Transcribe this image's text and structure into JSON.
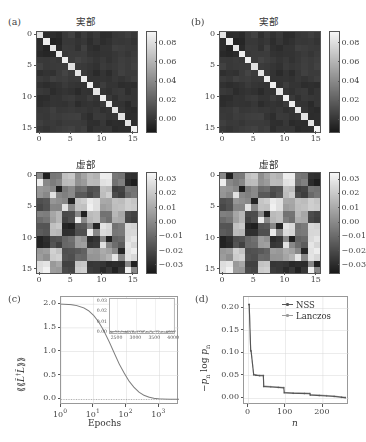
{
  "figure": {
    "panels": [
      {
        "label": "(a)",
        "title": "実部"
      },
      {
        "label": "(b)",
        "title": "実部"
      },
      {
        "label": "(a2)",
        "title": "虚部"
      },
      {
        "label": "(b2)",
        "title": "虚部"
      },
      {
        "label": "(c)",
        "title": ""
      },
      {
        "label": "(d)",
        "title": ""
      }
    ],
    "panel_a_label": "(a)",
    "panel_b_label": "(b)",
    "panel_c_label": "(c)",
    "panel_d_label": "(d)",
    "title_real": "実部",
    "title_imag": "虚部"
  },
  "heatmaps": {
    "axis_ticks": [
      "0",
      "5",
      "10",
      "15"
    ],
    "axis_tick_values": [
      0,
      5,
      10,
      15
    ],
    "size": 16,
    "real": {
      "cbar_ticks": [
        "0.08",
        "0.06",
        "0.04",
        "0.02",
        "0.00"
      ],
      "cbar_tick_values": [
        0.08,
        0.06,
        0.04,
        0.02,
        0.0
      ],
      "vmin": -0.012,
      "vmax": 0.092
    },
    "imag": {
      "cbar_ticks": [
        "0.03",
        "0.02",
        "0.01",
        "0.00",
        "−0.01",
        "−0.02",
        "−0.03"
      ],
      "cbar_tick_values": [
        0.03,
        0.02,
        0.01,
        0.0,
        -0.01,
        -0.02,
        -0.03
      ],
      "vmin": -0.035,
      "vmax": 0.035
    }
  },
  "chart_data": [
    {
      "type": "heatmap",
      "panel": "(a)",
      "title": "実部",
      "xlabel": "",
      "ylabel": "",
      "xticks": [
        0,
        5,
        10,
        15
      ],
      "yticks": [
        0,
        5,
        10,
        15
      ],
      "colorbar_ticks": [
        0.0,
        0.02,
        0.04,
        0.06,
        0.08
      ],
      "zlim": [
        -0.012,
        0.092
      ],
      "nrows": 16,
      "ncols": 16,
      "description": "Real part of density matrix: bright diagonal near 0.085, dark off-diagonal noise near 0.0"
    },
    {
      "type": "heatmap",
      "panel": "(b)",
      "title": "実部",
      "xticks": [
        0,
        5,
        10,
        15
      ],
      "yticks": [
        0,
        5,
        10,
        15
      ],
      "colorbar_ticks": [
        0.0,
        0.02,
        0.04,
        0.06,
        0.08
      ],
      "zlim": [
        -0.012,
        0.092
      ],
      "nrows": 16,
      "ncols": 16,
      "description": "Real part, second method; visually matching panel (a)"
    },
    {
      "type": "heatmap",
      "panel": "(a) lower",
      "title": "虚部",
      "xticks": [
        0,
        5,
        10,
        15
      ],
      "yticks": [
        0,
        5,
        10,
        15
      ],
      "colorbar_ticks": [
        -0.03,
        -0.02,
        -0.01,
        0.0,
        0.01,
        0.02,
        0.03
      ],
      "zlim": [
        -0.035,
        0.035
      ],
      "nrows": 16,
      "ncols": 16,
      "description": "Imaginary part: antisymmetric block structure, mid-gray background"
    },
    {
      "type": "heatmap",
      "panel": "(b) lower",
      "title": "虚部",
      "xticks": [
        0,
        5,
        10,
        15
      ],
      "yticks": [
        0,
        5,
        10,
        15
      ],
      "colorbar_ticks": [
        -0.03,
        -0.02,
        -0.01,
        0.0,
        0.01,
        0.02,
        0.03
      ],
      "zlim": [
        -0.035,
        0.035
      ],
      "nrows": 16,
      "ncols": 16,
      "description": "Imaginary part, second method"
    },
    {
      "type": "line",
      "panel": "(c)",
      "title": "",
      "xlabel": "Epochs",
      "ylabel": "⟨⟨L̂†L̂⟩⟩",
      "xscale": "log",
      "xlim": [
        1,
        4000
      ],
      "ylim": [
        -0.12,
        2.15
      ],
      "xticks": [
        1,
        10,
        100,
        1000
      ],
      "xtick_labels": [
        "10⁰",
        "10¹",
        "10²",
        "10³"
      ],
      "yticks": [
        0.0,
        0.5,
        1.0,
        1.5,
        2.0
      ],
      "ytick_labels": [
        "0.0",
        "0.5",
        "1.0",
        "1.5",
        "2.0"
      ],
      "grid": true,
      "series": [
        {
          "name": "loss",
          "x": [
            1,
            2,
            3,
            5,
            7,
            10,
            14,
            20,
            30,
            45,
            60,
            85,
            120,
            170,
            240,
            340,
            480,
            700,
            1000,
            1500,
            2200,
            3200,
            4000
          ],
          "y": [
            2.0,
            1.99,
            1.97,
            1.92,
            1.86,
            1.76,
            1.63,
            1.45,
            1.2,
            0.93,
            0.74,
            0.55,
            0.38,
            0.25,
            0.15,
            0.085,
            0.045,
            0.02,
            0.008,
            0.004,
            0.002,
            0.001,
            0.001
          ]
        },
        {
          "name": "zero-reference",
          "style": "dotted",
          "y_const": 0.0
        }
      ],
      "inset": {
        "xlim": [
          2300,
          4050
        ],
        "ylim": [
          -0.002,
          0.032
        ],
        "xticks": [
          2500,
          3000,
          3500,
          4000
        ],
        "xtick_labels": [
          "2500",
          "3000",
          "3500",
          "4000"
        ],
        "yticks": [
          0.0,
          0.01,
          0.02,
          0.03
        ],
        "ytick_labels": [
          "0.00",
          "0.01",
          "0.02",
          "0.03"
        ],
        "description": "Zoomed tail: noisy fluctuation around 0.001"
      }
    },
    {
      "type": "line",
      "panel": "(d)",
      "title": "",
      "xlabel": "n",
      "ylabel": "−pₙ log pₙ",
      "xlim": [
        -12,
        270
      ],
      "ylim": [
        -0.015,
        0.225
      ],
      "xticks": [
        0,
        100,
        200
      ],
      "xtick_labels": [
        "0",
        "100",
        "200"
      ],
      "yticks": [
        0.0,
        0.05,
        0.1,
        0.15,
        0.2
      ],
      "ytick_labels": [
        "0.00",
        "0.05",
        "0.10",
        "0.15",
        "0.20"
      ],
      "grid": true,
      "legend": [
        "NSS",
        "Lanczos"
      ],
      "legend_position": "top-right",
      "series": [
        {
          "name": "NSS",
          "color": "#555555",
          "x": [
            1,
            2,
            6,
            7,
            14,
            20,
            30,
            40,
            41,
            60,
            80,
            95,
            96,
            120,
            150,
            165,
            166,
            190,
            210,
            230,
            250,
            260
          ],
          "y": [
            0.208,
            0.208,
            0.105,
            0.105,
            0.052,
            0.051,
            0.05,
            0.05,
            0.026,
            0.025,
            0.024,
            0.023,
            0.012,
            0.011,
            0.0105,
            0.01,
            0.007,
            0.006,
            0.005,
            0.004,
            0.002,
            0.001
          ]
        },
        {
          "name": "Lanczos",
          "color": "#999999",
          "x": [
            1,
            2,
            6,
            7,
            14,
            20,
            30,
            40,
            41,
            60,
            80,
            95,
            96,
            120,
            150,
            165,
            166,
            190,
            210,
            230,
            250,
            260
          ],
          "y": [
            0.209,
            0.209,
            0.106,
            0.106,
            0.053,
            0.052,
            0.051,
            0.051,
            0.027,
            0.026,
            0.025,
            0.024,
            0.013,
            0.012,
            0.0115,
            0.011,
            0.008,
            0.007,
            0.006,
            0.005,
            0.003,
            0.002
          ]
        }
      ]
    }
  ],
  "panel_c": {
    "xlabel": "Epochs",
    "xtick_labels": [
      "10",
      "10",
      "10",
      "10"
    ],
    "xtick_exponents": [
      "0",
      "1",
      "2",
      "3"
    ],
    "ytick_labels": [
      "2.0",
      "1.5",
      "1.0",
      "0.5",
      "0.0"
    ],
    "inset_xticks": [
      "2500",
      "3000",
      "3500",
      "4000"
    ],
    "inset_yticks": [
      "0.03",
      "0.02",
      "0.01",
      "0.00"
    ]
  },
  "panel_d": {
    "xlabel": "n",
    "xtick_labels": [
      "0",
      "100",
      "200"
    ],
    "ytick_labels": [
      "0.20",
      "0.15",
      "0.10",
      "0.05",
      "0.00"
    ],
    "legend": [
      {
        "label": "NSS",
        "color": "#555555"
      },
      {
        "label": "Lanczos",
        "color": "#9a9a9a"
      }
    ]
  },
  "colors": {
    "axis": "#555555",
    "grid": "#d8d8d8",
    "curve": "#7a7a7a",
    "nss": "#555555",
    "lanczos": "#9a9a9a",
    "text": "#333333"
  }
}
